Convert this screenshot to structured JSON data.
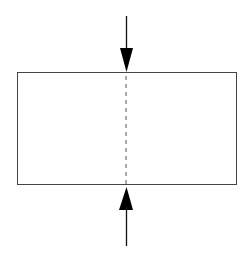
{
  "diagram": {
    "colors": {
      "background": "#ffffff",
      "stroke": "#333333",
      "arrow": "#000000",
      "dashed_line": "#555555"
    },
    "block": {
      "x": 17,
      "y": 72,
      "width": 220,
      "height": 113
    },
    "centerline": {
      "x": 126,
      "y1": 73,
      "y2": 185,
      "style": "dashed"
    },
    "arrows": [
      {
        "id": "top",
        "direction": "down",
        "x": 126,
        "tail_y": 16,
        "tip_y": 72
      },
      {
        "id": "bottom",
        "direction": "up",
        "x": 126,
        "tail_y": 246,
        "tip_y": 187
      }
    ]
  }
}
